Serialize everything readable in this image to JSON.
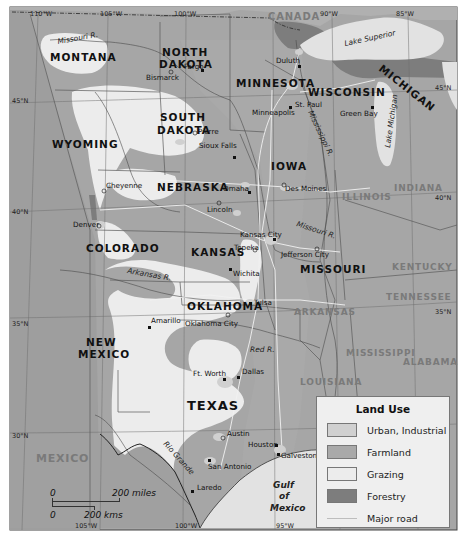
{
  "map": {
    "title": "Land Use",
    "colors": {
      "background": "#a6a6a6",
      "urban": "#d0d0d0",
      "farmland": "#a9a9a9",
      "grazing": "#ececec",
      "forestry": "#7d7d7d",
      "water": "#e2e2e2",
      "road": "#f2f2f2",
      "border": "#555555"
    },
    "countries": {
      "canada": "CANADA",
      "mexico": "MEXICO"
    },
    "states_bold": {
      "montana": "MONTANA",
      "north_dakota_1": "NORTH",
      "north_dakota_2": "DAKOTA",
      "minnesota": "MINNESOTA",
      "wisconsin": "WISCONSIN",
      "michigan": "MICHIGAN",
      "south_dakota_1": "SOUTH",
      "south_dakota_2": "DAKOTA",
      "wyoming": "WYOMING",
      "iowa": "IOWA",
      "nebraska": "NEBRASKA",
      "colorado": "COLORADO",
      "kansas": "KANSAS",
      "missouri": "MISSOURI",
      "oklahoma": "OKLAHOMA",
      "new_mexico_1": "NEW",
      "new_mexico_2": "MEXICO",
      "texas": "TEXAS"
    },
    "states_grey": {
      "illinois": "ILLINOIS",
      "indiana": "INDIANA",
      "kentucky": "KENTUCKY",
      "tennessee": "TENNESSEE",
      "arkansas": "ARKANSAS",
      "mississippi": "MISSISSIPPI",
      "alabama": "ALABAMA",
      "louisiana": "LOUISIANA"
    },
    "cities": {
      "fargo": "Fargo",
      "bismarck": "Bismarck",
      "duluth": "Duluth",
      "st_paul": "St. Paul",
      "minneapolis": "Minneapolis",
      "green_bay": "Green Bay",
      "pierre": "Pierre",
      "sioux_falls": "Sioux Falls",
      "cheyenne": "Cheyenne",
      "omaha": "Omaha",
      "des_moines": "Des Moines",
      "lincoln": "Lincoln",
      "denver": "Denver",
      "kansas_city": "Kansas City",
      "topeka": "Topeka",
      "jefferson_city": "Jefferson City",
      "wichita": "Wichita",
      "tulsa": "Tulsa",
      "amarillo": "Amarillo",
      "oklahoma_city": "Oklahoma City",
      "ft_worth": "Ft. Worth",
      "dallas": "Dallas",
      "austin": "Austin",
      "houston": "Houston",
      "galveston": "Galveston",
      "san_antonio": "San Antonio",
      "laredo": "Laredo"
    },
    "water": {
      "lake_superior": "Lake Superior",
      "lake_michigan": "Lake Michigan",
      "gulf_1": "Gulf",
      "gulf_2": "of",
      "gulf_3": "Mexico"
    },
    "rivers": {
      "missouri_top": "Missouri R.",
      "mississippi": "Mississippi R.",
      "missouri_mid": "Missouri R.",
      "arkansas": "Arkansas R.",
      "red": "Red R.",
      "rio_grande": "Rio Grande"
    },
    "coordinates": {
      "lon_110": "110°W",
      "lon_105_top": "105°W",
      "lon_100_top": "100°W",
      "lon_90": "90°W",
      "lon_85": "85°W",
      "lat_45_left": "45°N",
      "lat_45_right": "45°N",
      "lat_40_left": "40°N",
      "lat_40_right": "40°N",
      "lat_35_left": "35°N",
      "lat_35_right": "35°N",
      "lat_30": "30°N",
      "lon_105_bottom": "105°W",
      "lon_100_bottom": "100°W",
      "lon_95_bottom": "95°W"
    }
  },
  "legend": {
    "title": "Land Use",
    "items": [
      {
        "label": "Urban, Industrial",
        "color": "#d0d0d0",
        "kind": "area"
      },
      {
        "label": "Farmland",
        "color": "#a9a9a9",
        "kind": "area"
      },
      {
        "label": "Grazing",
        "color": "#ececec",
        "kind": "area"
      },
      {
        "label": "Forestry",
        "color": "#7d7d7d",
        "kind": "area"
      },
      {
        "label": "Major road",
        "color": "#bdbdbd",
        "kind": "line"
      }
    ]
  },
  "scale_bar": {
    "miles_zero": "0",
    "miles_label": "200 miles",
    "km_zero": "0",
    "km_label": "200 kms"
  }
}
